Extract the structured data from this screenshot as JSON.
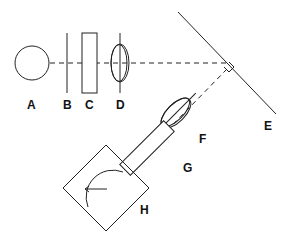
{
  "diagram": {
    "type": "optical-schematic",
    "components": [
      {
        "id": "A",
        "label": "A",
        "shape": "circle"
      },
      {
        "id": "B",
        "label": "B",
        "shape": "vertical-line"
      },
      {
        "id": "C",
        "label": "C",
        "shape": "rectangle"
      },
      {
        "id": "D",
        "label": "D",
        "shape": "lens"
      },
      {
        "id": "E",
        "label": "E",
        "shape": "mirror-line"
      },
      {
        "id": "F",
        "label": "F",
        "shape": "lens"
      },
      {
        "id": "G",
        "label": "G",
        "shape": "rectangle"
      },
      {
        "id": "H",
        "label": "H",
        "shape": "diamond-with-dial"
      }
    ],
    "colors": {
      "line": "#222222",
      "background": "#ffffff"
    }
  }
}
